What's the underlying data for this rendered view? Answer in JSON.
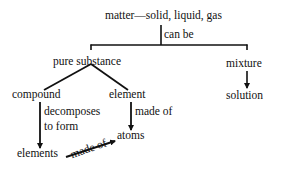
{
  "diagram": {
    "type": "concept-map",
    "nodes": {
      "matter": "matter—solid, liquid, gas",
      "pure_substance": "pure substance",
      "mixture": "mixture",
      "compound": "compound",
      "element": "element",
      "solution": "solution",
      "atoms": "atoms",
      "elements": "elements"
    },
    "edge_labels": {
      "can_be": "can be",
      "decomposes_line1": "decomposes",
      "decomposes_line2": "to form",
      "element_made_of": "made of",
      "elements_made_of": "made of"
    },
    "edges": [
      {
        "from": "matter",
        "to": "pure_substance",
        "label": "can be"
      },
      {
        "from": "matter",
        "to": "mixture",
        "label": "can be"
      },
      {
        "from": "pure_substance",
        "to": "compound",
        "label": ""
      },
      {
        "from": "pure_substance",
        "to": "element",
        "label": ""
      },
      {
        "from": "mixture",
        "to": "solution",
        "label": ""
      },
      {
        "from": "compound",
        "to": "elements",
        "label": "decomposes to form"
      },
      {
        "from": "element",
        "to": "atoms",
        "label": "made of"
      },
      {
        "from": "elements",
        "to": "atoms",
        "label": "made of"
      }
    ],
    "colors": {
      "line": "#111111",
      "text": "#111111",
      "background": "#ffffff"
    }
  }
}
